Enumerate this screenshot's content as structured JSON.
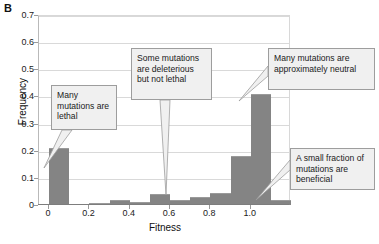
{
  "panel": {
    "label": "B"
  },
  "chart_data": {
    "type": "bar",
    "title": "",
    "xlabel": "Fitness",
    "ylabel": "Frequency",
    "categories": [
      "0.0",
      "0.1",
      "0.2",
      "0.3",
      "0.4",
      "0.5",
      "0.6",
      "0.7",
      "0.8",
      "0.9",
      "1.0",
      "1.1"
    ],
    "values": [
      0.21,
      0.0,
      0.008,
      0.018,
      0.012,
      0.04,
      0.02,
      0.03,
      0.045,
      0.18,
      0.41,
      0.02
    ],
    "bin_width": 0.1,
    "xlim": [
      -0.05,
      1.2
    ],
    "ylim": [
      0,
      0.7
    ],
    "xticks": [
      "0",
      "0.2",
      "0.4",
      "0.6",
      "0.8",
      "1.0"
    ],
    "xtick_values": [
      0,
      0.2,
      0.4,
      0.6,
      0.8,
      1.0
    ],
    "yticks": [
      "0",
      "0.1",
      "0.2",
      "0.3",
      "0.4",
      "0.5",
      "0.6",
      "0.7"
    ],
    "ytick_values": [
      0,
      0.1,
      0.2,
      0.3,
      0.4,
      0.5,
      0.6,
      0.7
    ],
    "grid": "horizontal",
    "legend": "none",
    "bar_color": "#848484",
    "grid_color": "#d9d9d9",
    "annotations": [
      {
        "id": "lethal",
        "text": "Many mutations are lethal",
        "points_to_x": 0.0
      },
      {
        "id": "deleterious",
        "text": "Some mutations are deleterious but not lethal",
        "points_to_x": 0.5
      },
      {
        "id": "neutral",
        "text": "Many mutations are approximately neutral",
        "points_to_x": 1.0
      },
      {
        "id": "beneficial",
        "text": "A small fraction of mutations are beneficial",
        "points_to_x": 1.1
      }
    ]
  }
}
